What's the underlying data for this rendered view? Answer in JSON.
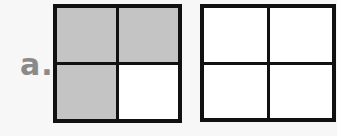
{
  "label": "a.",
  "colors": {
    "shaded": "#c4c4c4",
    "unshaded": "#ffffff",
    "border": "#111111",
    "label": "#8a8a8a"
  },
  "grids": [
    {
      "rows": 2,
      "cols": 2,
      "shaded_cells": [
        [
          0,
          0
        ],
        [
          0,
          1
        ],
        [
          1,
          0
        ]
      ],
      "shaded_count": 3,
      "total": 4
    },
    {
      "rows": 2,
      "cols": 2,
      "shaded_cells": [],
      "shaded_count": 0,
      "total": 4
    }
  ]
}
